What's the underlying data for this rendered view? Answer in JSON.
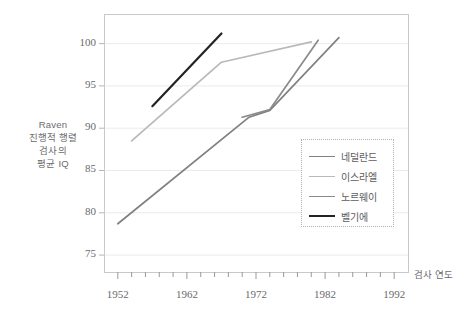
{
  "chart_data": {
    "type": "line",
    "title": "",
    "xlabel": "검사 연도",
    "ylabel_lines": [
      "Raven",
      "진행적 행렬",
      "검사의",
      "평균 IQ"
    ],
    "ylabel": "Raven 진행적 행렬 검사의 평균 IQ",
    "xlim": [
      1950,
      1994
    ],
    "ylim": [
      73,
      103.5
    ],
    "xticks": [
      1952,
      1962,
      1972,
      1982,
      1992
    ],
    "xtick_labels": [
      "1952",
      "1962",
      "1972",
      "1982",
      "1992"
    ],
    "minor_tick_interval": 2,
    "yticks": [
      75,
      80,
      85,
      90,
      95,
      100
    ],
    "ytick_labels": [
      "75",
      "80",
      "85",
      "90",
      "95",
      "100"
    ],
    "grid": "horizontal",
    "grid_color": "#eceaea",
    "legend_position": "center-right",
    "series": [
      {
        "name": "네덜란드",
        "color": "#818183",
        "width": 1.7,
        "points": [
          [
            1952,
            78.7
          ],
          [
            1971,
            91.3
          ],
          [
            1974,
            92.1
          ],
          [
            1984,
            100.7
          ]
        ]
      },
      {
        "name": "이스라엘",
        "color": "#b9b9bb",
        "width": 1.7,
        "points": [
          [
            1954,
            88.5
          ],
          [
            1967,
            97.8
          ],
          [
            1980,
            100.2
          ]
        ]
      },
      {
        "name": "노르웨이",
        "color": "#8a8a8c",
        "width": 1.7,
        "points": [
          [
            1970,
            91.3
          ],
          [
            1974,
            92.2
          ],
          [
            1981,
            100.4
          ]
        ]
      },
      {
        "name": "벨기에",
        "color": "#232325",
        "width": 2.2,
        "points": [
          [
            1957,
            92.6
          ],
          [
            1967,
            101.2
          ]
        ]
      }
    ]
  },
  "axes": {
    "frame_color": "#c9c9cb",
    "x_axis_title": "검사 연도",
    "y_axis_title_lines": [
      "Raven",
      "진행적 행렬",
      "검사의",
      "평균 IQ"
    ]
  },
  "legend": {
    "entries": [
      {
        "label": "네덜란드",
        "color": "#818183",
        "width": 1.7
      },
      {
        "label": "이스라엘",
        "color": "#b9b9bb",
        "width": 1.7
      },
      {
        "label": "노르웨이",
        "color": "#8a8a8c",
        "width": 1.7
      },
      {
        "label": "벨기에",
        "color": "#232325",
        "width": 2.2
      }
    ]
  }
}
